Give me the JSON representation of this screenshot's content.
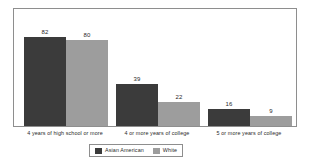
{
  "chart_data": {
    "type": "bar",
    "title": "",
    "subtitle": "",
    "xlabel": "",
    "ylabel": "",
    "ylim": [
      0,
      100
    ],
    "grid": false,
    "legend_position": "bottom-center",
    "categories": [
      "4 years of high school or more",
      "4 or more years of college",
      "5 or more years of college"
    ],
    "series": [
      {
        "name": "Asian American",
        "color": "#3b3b3b",
        "values": [
          82,
          39,
          16
        ]
      },
      {
        "name": "White",
        "color": "#9d9d9d",
        "values": [
          80,
          22,
          9
        ]
      }
    ],
    "data_labels": [
      [
        "82",
        "80"
      ],
      [
        "39",
        "22"
      ],
      [
        "16",
        "9"
      ]
    ]
  },
  "legend": {
    "entries": [
      {
        "label": "Asian American",
        "swatch": "legend-swatch-asian-american"
      },
      {
        "label": "White",
        "swatch": "legend-swatch-white"
      }
    ]
  },
  "colors": {
    "series_dark": "#3b3b3b",
    "series_light": "#9d9d9d",
    "frame": "#8e8e8e",
    "text": "#2a2a2a",
    "background": "#ffffff"
  }
}
